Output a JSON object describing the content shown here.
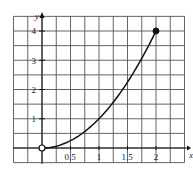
{
  "chart_data": {
    "type": "line",
    "title": "",
    "xlabel": "x",
    "ylabel": "y",
    "xlim": [
      -0.5,
      2.5
    ],
    "ylim": [
      -0.5,
      4.5
    ],
    "grid": true,
    "grid_step_x": 0.25,
    "grid_step_y": 0.5,
    "x_ticks": [
      "0.5",
      "1",
      "1.5",
      "2"
    ],
    "y_ticks": [
      "1",
      "2",
      "3",
      "4"
    ],
    "series": [
      {
        "name": "y = x^2",
        "function": "x^2",
        "domain": [
          0,
          2
        ],
        "x": [
          0,
          0.25,
          0.5,
          0.75,
          1,
          1.25,
          1.5,
          1.75,
          2
        ],
        "y": [
          0,
          0.0625,
          0.25,
          0.5625,
          1,
          1.5625,
          2.25,
          3.0625,
          4
        ]
      }
    ],
    "endpoints": [
      {
        "x": 0,
        "y": 0,
        "style": "open"
      },
      {
        "x": 2,
        "y": 4,
        "style": "closed"
      }
    ]
  },
  "labels": {
    "x_axis": "x",
    "y_axis": "y",
    "x_ticks": [
      "0.5",
      "1",
      "1.5",
      "2"
    ],
    "y_ticks": [
      "1",
      "2",
      "3",
      "4"
    ]
  }
}
